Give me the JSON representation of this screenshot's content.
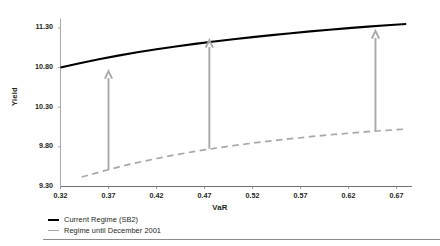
{
  "chart_data": {
    "type": "line",
    "title": "",
    "xlabel": "VaR",
    "ylabel": "Yield",
    "xlim": [
      0.32,
      0.685
    ],
    "ylim": [
      9.3,
      11.45
    ],
    "grid": false,
    "legend_position": "bottom-left",
    "xticks": [
      "0.32",
      "0.37",
      "0.42",
      "0.47",
      "0.52",
      "0.57",
      "0.62",
      "0.67"
    ],
    "xtick_values": [
      0.32,
      0.37,
      0.42,
      0.47,
      0.52,
      0.57,
      0.62,
      0.67
    ],
    "yticks": [
      "9.30",
      "9.80",
      "10.30",
      "10.80",
      "11.30"
    ],
    "ytick_values": [
      9.3,
      9.8,
      10.3,
      10.8,
      11.3
    ],
    "series": [
      {
        "name": "Current Regime (SB2)",
        "style": "solid",
        "color": "#000000",
        "x": [
          0.32,
          0.34,
          0.36,
          0.38,
          0.4,
          0.42,
          0.44,
          0.46,
          0.48,
          0.5,
          0.52,
          0.54,
          0.56,
          0.58,
          0.6,
          0.62,
          0.64,
          0.66,
          0.68
        ],
        "y": [
          10.8,
          10.855,
          10.905,
          10.95,
          10.992,
          11.03,
          11.065,
          11.098,
          11.128,
          11.157,
          11.184,
          11.209,
          11.233,
          11.256,
          11.277,
          11.297,
          11.316,
          11.334,
          11.35
        ]
      },
      {
        "name": "Regime until December 2001",
        "style": "dashed",
        "color": "#a6a8ab",
        "x": [
          0.342,
          0.36,
          0.38,
          0.4,
          0.42,
          0.44,
          0.46,
          0.48,
          0.5,
          0.52,
          0.54,
          0.56,
          0.58,
          0.6,
          0.62,
          0.64,
          0.66,
          0.68
        ],
        "y": [
          9.42,
          9.48,
          9.545,
          9.602,
          9.653,
          9.7,
          9.742,
          9.78,
          9.815,
          9.847,
          9.876,
          9.903,
          9.928,
          9.951,
          9.972,
          9.991,
          10.008,
          10.025
        ]
      }
    ],
    "annotations": [
      {
        "type": "arrow",
        "x": 0.37,
        "y_from": 9.512,
        "y_to": 10.755,
        "color": "#a6a8ab",
        "direction": "up"
      },
      {
        "type": "arrow",
        "x": 0.475,
        "y_from": 9.776,
        "y_to": 11.146,
        "color": "#a6a8ab",
        "direction": "up"
      },
      {
        "type": "arrow",
        "x": 0.648,
        "y_from": 9.998,
        "y_to": 11.262,
        "color": "#a6a8ab",
        "direction": "up"
      }
    ]
  },
  "legend": {
    "items": [
      {
        "label": "Current Regime (SB2)"
      },
      {
        "label": "Regime until December 2001"
      }
    ]
  }
}
